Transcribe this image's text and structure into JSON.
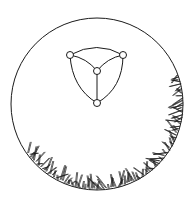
{
  "diagram": {
    "colors": {
      "stroke": "#1a1a1a",
      "background": "#ffffff"
    },
    "circle": {
      "cx": 97,
      "cy": 104,
      "r": 86
    },
    "graph": {
      "nodes": [
        {
          "id": "top-left",
          "x": 70,
          "y": 55
        },
        {
          "id": "top-right",
          "x": 123,
          "y": 55
        },
        {
          "id": "center",
          "x": 97,
          "y": 71
        },
        {
          "id": "bottom",
          "x": 97,
          "y": 103
        }
      ],
      "node_radius": 3.5
    },
    "hatching": {
      "region": "lower-right rim of circle"
    }
  }
}
